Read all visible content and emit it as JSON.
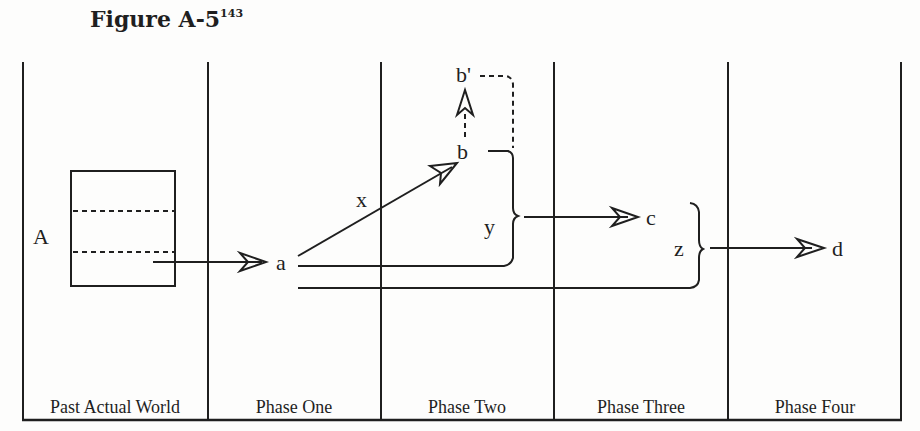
{
  "figure": {
    "title": "Figure A-5",
    "footnote": "143"
  },
  "columns": [
    {
      "label": "Past Actual World"
    },
    {
      "label": "Phase One"
    },
    {
      "label": "Phase Two"
    },
    {
      "label": "Phase Three"
    },
    {
      "label": "Phase Four"
    }
  ],
  "nodes": {
    "A": "A",
    "a": "a",
    "b": "b",
    "b_prime": "b'",
    "c": "c",
    "d": "d"
  },
  "edge_labels": {
    "x": "x",
    "y": "y",
    "z": "z"
  },
  "colors": {
    "ink": "#1f1f1f",
    "background": "#fdfdfc"
  }
}
